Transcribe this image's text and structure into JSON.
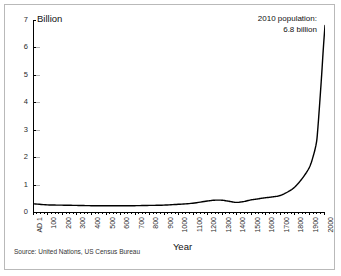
{
  "figure": {
    "y_axis_title": "Billion",
    "x_axis_title": "Year",
    "annotation_line1": "2010 population:",
    "annotation_line2": "6.8 billion",
    "source": "Source: United Nations, US Census Bureau",
    "line_color": "#000000",
    "frame_color": "#b9b9b9",
    "background": "#ffffff"
  },
  "chart_data": {
    "type": "line",
    "title": "",
    "subtitle": "",
    "xlabel": "Year",
    "ylabel": "Billion",
    "xlim": [
      1,
      2010
    ],
    "ylim": [
      0,
      7
    ],
    "grid": false,
    "legend": "none",
    "y_ticks": [
      0,
      1,
      2,
      3,
      4,
      5,
      6,
      7
    ],
    "y_tick_labels": [
      "0",
      "1",
      "2",
      "3",
      "4",
      "5",
      "6",
      "7"
    ],
    "x_ticks": [
      1,
      100,
      200,
      300,
      400,
      500,
      600,
      700,
      800,
      900,
      1000,
      1100,
      1200,
      1300,
      1400,
      1500,
      1600,
      1700,
      1800,
      1900,
      2000
    ],
    "x_tick_labels": [
      "AD 1",
      "100",
      "200",
      "300",
      "400",
      "500",
      "600",
      "700",
      "800",
      "900",
      "1000",
      "1100",
      "1200",
      "1300",
      "1400",
      "1500",
      "1600",
      "1700",
      "1800",
      "1900",
      "2000"
    ],
    "annotations": [
      {
        "text": "2010 population: 6.8 billion",
        "x": 1980,
        "y": 6.8
      }
    ],
    "series": [
      {
        "name": "World population",
        "units": "billion",
        "x": [
          1,
          100,
          200,
          300,
          400,
          500,
          600,
          700,
          800,
          900,
          1000,
          1100,
          1200,
          1250,
          1300,
          1350,
          1400,
          1450,
          1500,
          1550,
          1600,
          1650,
          1700,
          1750,
          1800,
          1850,
          1900,
          1927,
          1950,
          1960,
          1974,
          1987,
          1999,
          2010
        ],
        "y": [
          0.3,
          0.26,
          0.25,
          0.24,
          0.23,
          0.23,
          0.23,
          0.23,
          0.24,
          0.25,
          0.28,
          0.32,
          0.4,
          0.43,
          0.43,
          0.39,
          0.35,
          0.38,
          0.44,
          0.48,
          0.52,
          0.55,
          0.6,
          0.72,
          0.9,
          1.2,
          1.6,
          2.0,
          2.5,
          3.0,
          4.0,
          5.0,
          6.0,
          6.8
        ]
      }
    ]
  }
}
